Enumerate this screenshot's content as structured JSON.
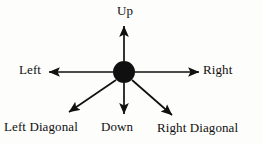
{
  "diagram": {
    "type": "radial-arrow-diagram",
    "canvas": {
      "width": 262,
      "height": 144
    },
    "background_color": "#fdfdfc",
    "stroke_color": "#101010",
    "hub": {
      "name": "center-node",
      "shape": "filled-circle",
      "cx": 124,
      "cy": 72,
      "r": 11,
      "fill": "#101010"
    },
    "arrows": [
      {
        "id": "up",
        "label": "Up",
        "direction": "up",
        "angle_deg": 90,
        "from": {
          "x": 124,
          "y": 61
        },
        "to": {
          "x": 124,
          "y": 24
        }
      },
      {
        "id": "left",
        "label": "Left",
        "direction": "left",
        "angle_deg": 180,
        "from": {
          "x": 113,
          "y": 72
        },
        "to": {
          "x": 47,
          "y": 72
        }
      },
      {
        "id": "right",
        "label": "Right",
        "direction": "right",
        "angle_deg": 0,
        "from": {
          "x": 135,
          "y": 72
        },
        "to": {
          "x": 201,
          "y": 72
        }
      },
      {
        "id": "down",
        "label": "Down",
        "direction": "down",
        "angle_deg": 270,
        "from": {
          "x": 124,
          "y": 83
        },
        "to": {
          "x": 124,
          "y": 117
        }
      },
      {
        "id": "left-diagonal",
        "label": "Left Diagonal",
        "direction": "down-left",
        "angle_deg": 210,
        "from": {
          "x": 115,
          "y": 81
        },
        "to": {
          "x": 66,
          "y": 114
        }
      },
      {
        "id": "right-diagonal",
        "label": "Right Diagonal",
        "direction": "down-right",
        "angle_deg": 330,
        "from": {
          "x": 133,
          "y": 81
        },
        "to": {
          "x": 175,
          "y": 118
        }
      }
    ]
  }
}
